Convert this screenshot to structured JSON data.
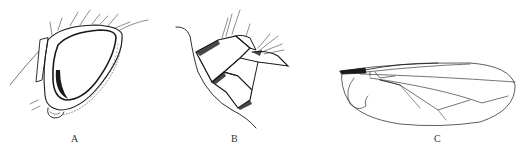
{
  "figure": {
    "panels": [
      {
        "label": "A",
        "subject": "head-lateral-view"
      },
      {
        "label": "B",
        "subject": "abdomen-terminalia"
      },
      {
        "label": "C",
        "subject": "wing"
      }
    ],
    "ink_color": "#1a1a1a",
    "background": "#ffffff"
  }
}
